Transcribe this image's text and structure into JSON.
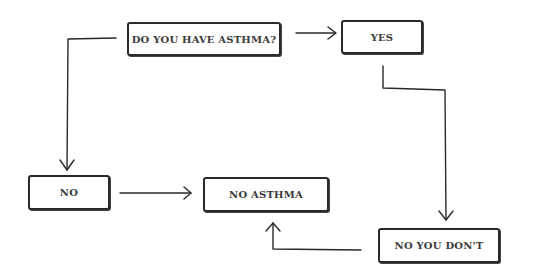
{
  "diagram": {
    "type": "flowchart",
    "nodes": {
      "question": "DO YOU HAVE ASTHMA?",
      "yes": "YES",
      "no": "NO",
      "no_asthma": "NO ASTHMA",
      "no_you_dont": "NO YOU DON'T"
    },
    "edges": [
      {
        "from": "DO YOU HAVE ASTHMA?",
        "to": "YES"
      },
      {
        "from": "DO YOU HAVE ASTHMA?",
        "to": "NO"
      },
      {
        "from": "YES",
        "to": "NO YOU DON'T"
      },
      {
        "from": "NO",
        "to": "NO ASTHMA"
      },
      {
        "from": "NO YOU DON'T",
        "to": "NO ASTHMA"
      }
    ],
    "colors": {
      "stroke": "#2a2a2a",
      "text": "#3a3a3a",
      "background": "#ffffff"
    }
  }
}
